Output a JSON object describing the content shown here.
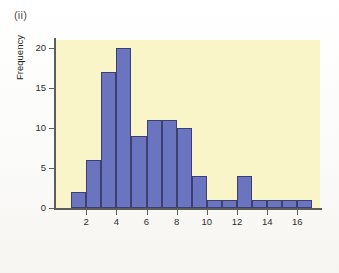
{
  "figure": {
    "panel_label": "(ii)",
    "background_color": "#ffffff",
    "plot_background_color": "#faf5c8",
    "bar_fill_color": "#6b74be",
    "bar_edge_color": "#3b3f72",
    "axis_color": "#5d5d5a"
  },
  "chart_data": {
    "type": "bar",
    "title": "(ii)",
    "subtitle": "",
    "xlabel": "",
    "ylabel": "Frequency",
    "grid": false,
    "legend": null,
    "legend_position": "none",
    "bin_width": 1,
    "xlim": [
      0,
      17.5
    ],
    "ylim": [
      0,
      21
    ],
    "x_ticks": [
      2,
      4,
      6,
      8,
      10,
      12,
      14,
      16
    ],
    "x_tick_labels": [
      "2",
      "4",
      "6",
      "8",
      "10",
      "12",
      "14",
      "16"
    ],
    "y_ticks": [
      0,
      5,
      10,
      15,
      20
    ],
    "y_tick_labels": [
      "0",
      "5",
      "10",
      "15",
      "20"
    ],
    "bin_edges": [
      1,
      2,
      3,
      4,
      5,
      6,
      7,
      8,
      9,
      10,
      11,
      12,
      13,
      14,
      15,
      16,
      17
    ],
    "categories": [
      "1-2",
      "2-3",
      "3-4",
      "4-5",
      "5-6",
      "6-7",
      "7-8",
      "8-9",
      "9-10",
      "10-11",
      "11-12",
      "12-13",
      "13-14",
      "14-15",
      "15-16",
      "16-17"
    ],
    "values": [
      2,
      6,
      17,
      20,
      9,
      11,
      11,
      10,
      4,
      1,
      1,
      4,
      1,
      1,
      1,
      1
    ],
    "annotations": []
  }
}
